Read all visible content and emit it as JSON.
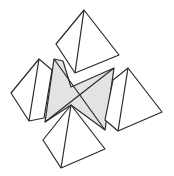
{
  "diagram": {
    "title": "",
    "colors": {
      "stroke": "#2b2b2b",
      "center_fill": "#e3e3e3",
      "pyramid_fill": "#ffffff",
      "background": "#ffffff"
    },
    "shapes": {
      "center": {
        "outline": "54,59 63,61 71,87 114,68 105,130 71,105 45,122",
        "edges": [
          "54,59 105,130",
          "114,68 45,122",
          "63,61 75,73"
        ]
      },
      "top_pyramid": {
        "outline": "84,10 56,44 75,73 119,55",
        "edges": [
          "84,10 75,73"
        ]
      },
      "left_pyramid": {
        "outline": "39,59 11,93 29,121 44,118 52,70",
        "edges": [
          "39,59 29,121"
        ]
      },
      "right_pyramid": {
        "outline": "128,68 162,112 118,131 105,120 113,80",
        "edges": [
          "128,68 118,131"
        ]
      },
      "bottom_pyramid": {
        "outline": "71,105 43,140 61,168 105,149",
        "edges": [
          "71,105 61,168"
        ]
      }
    }
  }
}
